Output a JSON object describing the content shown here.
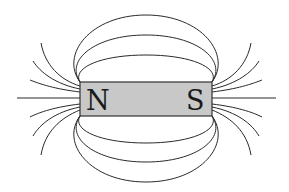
{
  "diagram": {
    "magnet": {
      "north_label": "N",
      "south_label": "S",
      "fill": "#c8c8c8"
    },
    "line_color": "#2a2a2a",
    "background": "#ffffff"
  }
}
